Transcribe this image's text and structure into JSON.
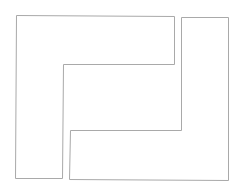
{
  "diagram": {
    "width": 243,
    "height": 193,
    "background": "#ffffff",
    "stroke_color": "#a9a9a9",
    "shapes": [
      {
        "name": "left-l-shape",
        "points": "16.5,15.5 174.5,16.5 174.5,64.5 63.5,64.5 62.5,178.5 15.5,178.5"
      },
      {
        "name": "right-l-shape",
        "points": "181.5,17.5 228.5,17.5 228.5,180.5 69.5,179.5 70.5,130.5 181.5,130.5"
      }
    ]
  }
}
